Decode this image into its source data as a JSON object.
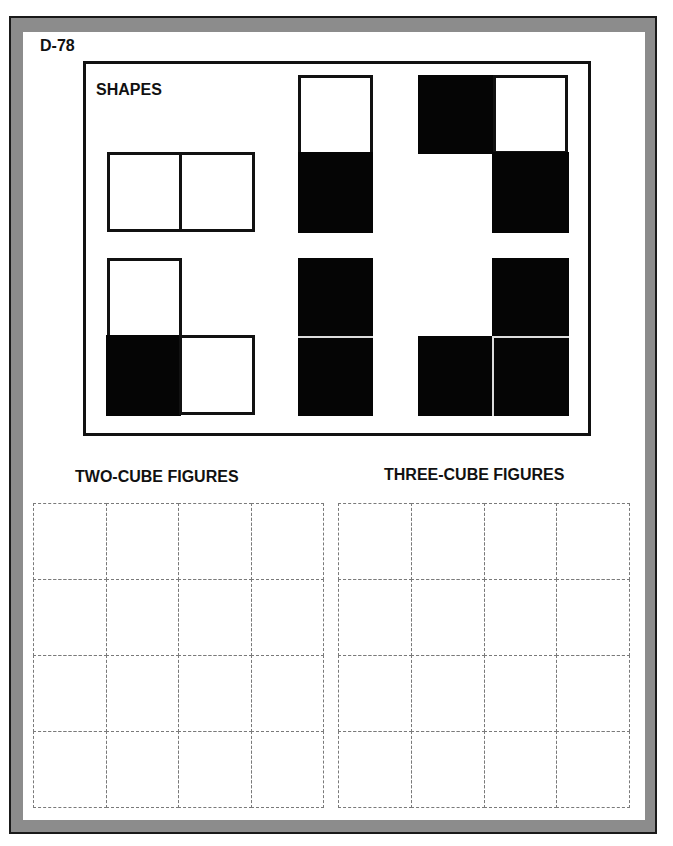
{
  "page": {
    "code": "D-78",
    "shapes_title": "SHAPES",
    "two_cube_title": "TWO-CUBE FIGURES",
    "three_cube_title": "THREE-CUBE FIGURES"
  },
  "colors": {
    "frame": "#8c8c8c",
    "ink": "#111111",
    "dash": "#7a7a7a"
  },
  "shapes": [
    {
      "name": "two-white-horizontal",
      "cells": [
        {
          "x": 107,
          "y": 152,
          "w": 75,
          "h": 80,
          "fill": "white"
        },
        {
          "x": 179,
          "y": 152,
          "w": 76,
          "h": 80,
          "fill": "white"
        }
      ]
    },
    {
      "name": "white-over-black-vertical",
      "cells": [
        {
          "x": 298,
          "y": 75,
          "w": 75,
          "h": 80,
          "fill": "white"
        },
        {
          "x": 298,
          "y": 152,
          "w": 75,
          "h": 81,
          "fill": "black"
        }
      ]
    },
    {
      "name": "three-cube-zigzag",
      "cells": [
        {
          "x": 418,
          "y": 75,
          "w": 77,
          "h": 79,
          "fill": "black"
        },
        {
          "x": 493,
          "y": 75,
          "w": 75,
          "h": 79,
          "fill": "white"
        },
        {
          "x": 492,
          "y": 152,
          "w": 77,
          "h": 81,
          "fill": "black"
        }
      ]
    },
    {
      "name": "three-cube-L",
      "cells": [
        {
          "x": 107,
          "y": 258,
          "w": 75,
          "h": 80,
          "fill": "white"
        },
        {
          "x": 106,
          "y": 335,
          "w": 75,
          "h": 81,
          "fill": "black"
        },
        {
          "x": 179,
          "y": 335,
          "w": 76,
          "h": 80,
          "fill": "white"
        }
      ]
    },
    {
      "name": "two-black-vertical",
      "cells": [
        {
          "x": 298,
          "y": 258,
          "w": 75,
          "h": 79,
          "fill": "black"
        },
        {
          "x": 298,
          "y": 338,
          "w": 75,
          "h": 78,
          "fill": "black"
        }
      ]
    },
    {
      "name": "three-black-L",
      "cells": [
        {
          "x": 492,
          "y": 258,
          "w": 77,
          "h": 79,
          "fill": "black"
        },
        {
          "x": 418,
          "y": 336,
          "w": 75,
          "h": 80,
          "fill": "black"
        },
        {
          "x": 494,
          "y": 338,
          "w": 75,
          "h": 78,
          "fill": "black"
        }
      ]
    }
  ],
  "grids": {
    "two_cube": {
      "x": 33,
      "y": 503,
      "cols": 4,
      "rows": 4,
      "colw": 72.5,
      "rowh": 76
    },
    "three_cube": {
      "x": 338,
      "y": 503,
      "cols": 4,
      "rows": 4,
      "colw": 72.8,
      "rowh": 76
    }
  }
}
